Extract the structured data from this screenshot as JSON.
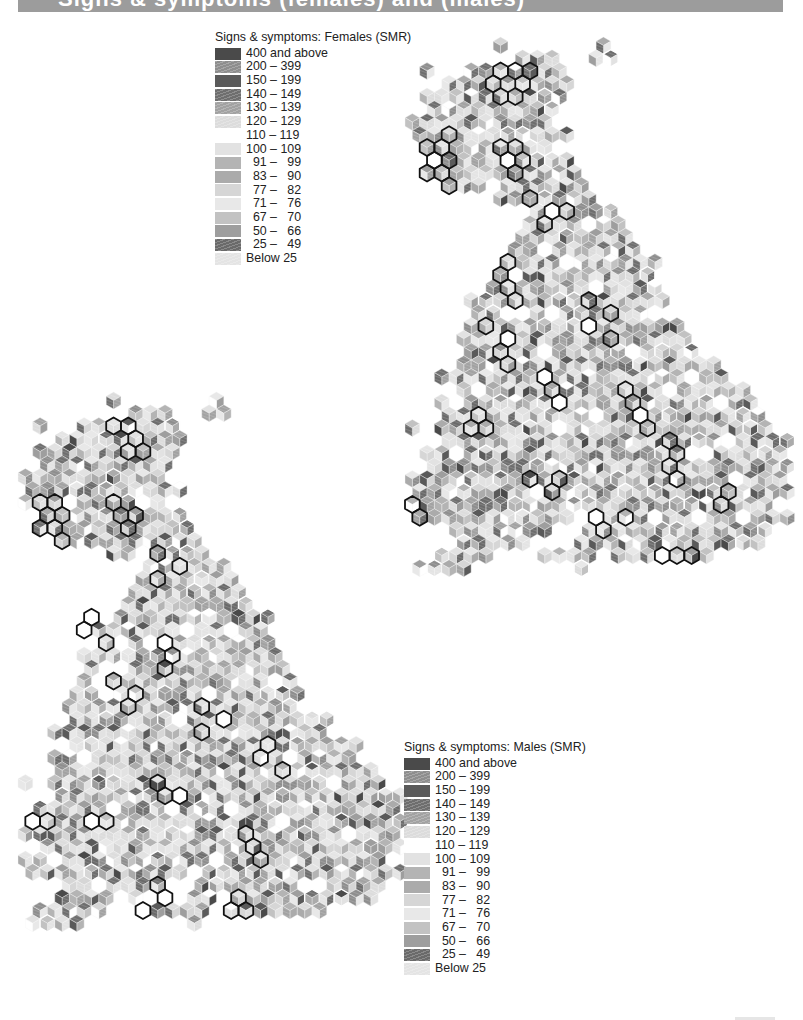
{
  "header": {
    "title": "Signs & symptoms (females) and (males)",
    "bar_color": "#9c9c9c"
  },
  "legend_females": {
    "title": "Signs & symptoms: Females (SMR)",
    "items": [
      {
        "label": "400 and above",
        "color": "#4a4a4a",
        "hatched": false
      },
      {
        "label": "200 – 399",
        "color": "#8e8e8e",
        "hatched": true
      },
      {
        "label": "150 – 199",
        "color": "#5a5a5a",
        "hatched": false
      },
      {
        "label": "140 – 149",
        "color": "#6e6e6e",
        "hatched": true
      },
      {
        "label": "130 – 139",
        "color": "#a2a2a2",
        "hatched": true
      },
      {
        "label": "120 – 129",
        "color": "#dcdcdc",
        "hatched": true
      },
      {
        "label": "110 – 119",
        "color": "#ffffff",
        "hatched": false
      },
      {
        "label": "100 – 109",
        "color": "#e2e2e2",
        "hatched": false
      },
      {
        "label": "  91 –   99",
        "color": "#b4b4b4",
        "hatched": false
      },
      {
        "label": "  83 –   90",
        "color": "#ababab",
        "hatched": false
      },
      {
        "label": "  77 –   82",
        "color": "#d6d6d6",
        "hatched": false
      },
      {
        "label": "  71 –   76",
        "color": "#e8e8e8",
        "hatched": false
      },
      {
        "label": "  67 –   70",
        "color": "#c2c2c2",
        "hatched": false
      },
      {
        "label": "  50 –   66",
        "color": "#9e9e9e",
        "hatched": false
      },
      {
        "label": "  25 –   49",
        "color": "#6a6a6a",
        "hatched": true
      },
      {
        "label": "Below 25",
        "color": "#e4e4e4",
        "hatched": true
      }
    ]
  },
  "legend_males": {
    "title": "Signs & symptoms: Males (SMR)",
    "items": [
      {
        "label": "400 and above",
        "color": "#4a4a4a",
        "hatched": false
      },
      {
        "label": "200 – 399",
        "color": "#8e8e8e",
        "hatched": true
      },
      {
        "label": "150 – 199",
        "color": "#5a5a5a",
        "hatched": false
      },
      {
        "label": "140 – 149",
        "color": "#6e6e6e",
        "hatched": true
      },
      {
        "label": "130 – 139",
        "color": "#a2a2a2",
        "hatched": true
      },
      {
        "label": "120 – 129",
        "color": "#dcdcdc",
        "hatched": true
      },
      {
        "label": "110 – 119",
        "color": "#ffffff",
        "hatched": false
      },
      {
        "label": "100 – 109",
        "color": "#e2e2e2",
        "hatched": false
      },
      {
        "label": "  91 –   99",
        "color": "#b4b4b4",
        "hatched": false
      },
      {
        "label": "  83 –   90",
        "color": "#ababab",
        "hatched": false
      },
      {
        "label": "  77 –   82",
        "color": "#d6d6d6",
        "hatched": false
      },
      {
        "label": "  71 –   76",
        "color": "#e8e8e8",
        "hatched": false
      },
      {
        "label": "  67 –   70",
        "color": "#c2c2c2",
        "hatched": false
      },
      {
        "label": "  50 –   66",
        "color": "#9e9e9e",
        "hatched": false
      },
      {
        "label": "  25 –   49",
        "color": "#6a6a6a",
        "hatched": true
      },
      {
        "label": "Below 25",
        "color": "#e4e4e4",
        "hatched": true
      }
    ]
  },
  "maps": {
    "hex": {
      "width": 14.7,
      "radius": 8.5,
      "row_height": 12.75
    },
    "shape_rows": [
      [
        [
          6,
          6
        ],
        [
          13,
          13
        ]
      ],
      [
        [
          7,
          9
        ],
        [
          12,
          13
        ]
      ],
      [
        [
          1,
          1
        ],
        [
          4,
          10
        ]
      ],
      [
        [
          2,
          10
        ]
      ],
      [
        [
          1,
          10
        ]
      ],
      [
        [
          1,
          9
        ]
      ],
      [
        [
          0,
          9
        ]
      ],
      [
        [
          0,
          10
        ]
      ],
      [
        [
          0,
          9
        ]
      ],
      [
        [
          1,
          10
        ]
      ],
      [
        [
          1,
          11
        ]
      ],
      [
        [
          2,
          11
        ]
      ],
      [
        [
          6,
          12
        ]
      ],
      [
        [
          8,
          13
        ]
      ],
      [
        [
          8,
          14
        ]
      ],
      [
        [
          7,
          14
        ]
      ],
      [
        [
          7,
          15
        ]
      ],
      [
        [
          6,
          16
        ]
      ],
      [
        [
          5,
          16
        ]
      ],
      [
        [
          5,
          16
        ]
      ],
      [
        [
          4,
          17
        ]
      ],
      [
        [
          4,
          17
        ]
      ],
      [
        [
          4,
          18
        ]
      ],
      [
        [
          3,
          18
        ]
      ],
      [
        [
          3,
          19
        ]
      ],
      [
        [
          3,
          20
        ]
      ],
      [
        [
          2,
          21
        ]
      ],
      [
        [
          3,
          22
        ]
      ],
      [
        [
          2,
          23
        ]
      ],
      [
        [
          2,
          23
        ]
      ],
      [
        [
          0,
          0
        ],
        [
          2,
          24
        ]
      ],
      [
        [
          2,
          25
        ]
      ],
      [
        [
          1,
          25
        ]
      ],
      [
        [
          1,
          25
        ]
      ],
      [
        [
          0,
          25
        ]
      ],
      [
        [
          0,
          25
        ]
      ],
      [
        [
          0,
          24
        ]
      ],
      [
        [
          0,
          10
        ],
        [
          12,
          25
        ]
      ],
      [
        [
          3,
          9
        ],
        [
          12,
          24
        ]
      ],
      [
        [
          2,
          7
        ],
        [
          11,
          23
        ]
      ],
      [
        [
          1,
          5
        ],
        [
          9,
          12
        ],
        [
          14,
          20
        ]
      ],
      [
        [
          0,
          3
        ],
        [
          11,
          11
        ]
      ]
    ],
    "females": {
      "origin": [
        405,
        37
      ],
      "seed": 17
    },
    "males": {
      "origin": [
        18,
        392
      ],
      "seed": 53
    },
    "outline_black": "#111111",
    "outline_white": "#ffffff"
  },
  "clusters": {
    "females": [
      [
        [
          2,
          6
        ],
        [
          2,
          7
        ],
        [
          3,
          5
        ],
        [
          3,
          7
        ],
        [
          2,
          8
        ]
      ],
      [
        [
          4,
          6
        ],
        [
          4,
          7
        ]
      ],
      [
        [
          8,
          1
        ],
        [
          9,
          1
        ],
        [
          10,
          1
        ],
        [
          8,
          2
        ],
        [
          9,
          2
        ],
        [
          10,
          2
        ],
        [
          11,
          2
        ],
        [
          7,
          2
        ]
      ],
      [
        [
          8,
          6
        ],
        [
          8,
          7
        ],
        [
          9,
          7
        ],
        [
          10,
          7
        ],
        [
          9,
          6
        ]
      ],
      [
        [
          12,
          8
        ],
        [
          13,
          9
        ],
        [
          14,
          9
        ],
        [
          13,
          10
        ]
      ],
      [
        [
          17,
          6
        ],
        [
          18,
          6
        ],
        [
          19,
          6
        ],
        [
          20,
          7
        ]
      ],
      [
        [
          20,
          12
        ],
        [
          21,
          13
        ],
        [
          22,
          12
        ],
        [
          23,
          13
        ]
      ],
      [
        [
          22,
          5
        ],
        [
          23,
          6
        ],
        [
          24,
          6
        ],
        [
          25,
          6
        ]
      ],
      [
        [
          26,
          9
        ],
        [
          27,
          9
        ],
        [
          28,
          10
        ]
      ],
      [
        [
          27,
          14
        ],
        [
          28,
          15
        ],
        [
          29,
          15
        ],
        [
          30,
          16
        ]
      ],
      [
        [
          29,
          4
        ],
        [
          30,
          4
        ],
        [
          30,
          5
        ]
      ],
      [
        [
          31,
          17
        ],
        [
          32,
          18
        ],
        [
          33,
          17
        ],
        [
          34,
          18
        ]
      ],
      [
        [
          34,
          8
        ],
        [
          35,
          9
        ],
        [
          34,
          10
        ]
      ],
      [
        [
          36,
          0
        ],
        [
          37,
          0
        ]
      ],
      [
        [
          37,
          12
        ],
        [
          38,
          13
        ],
        [
          37,
          14
        ]
      ],
      [
        [
          40,
          18
        ],
        [
          40,
          19
        ],
        [
          40,
          17
        ]
      ],
      [
        [
          35,
          21
        ],
        [
          36,
          21
        ]
      ]
    ],
    "males": [
      [
        [
          2,
          6
        ],
        [
          2,
          7
        ],
        [
          3,
          7
        ]
      ],
      [
        [
          4,
          7
        ],
        [
          4,
          8
        ]
      ],
      [
        [
          8,
          1
        ],
        [
          9,
          1
        ],
        [
          10,
          1
        ],
        [
          8,
          2
        ],
        [
          9,
          2
        ],
        [
          10,
          2
        ],
        [
          11,
          2
        ]
      ],
      [
        [
          8,
          6
        ],
        [
          9,
          7
        ],
        [
          10,
          7
        ],
        [
          9,
          6
        ]
      ],
      [
        [
          12,
          9
        ],
        [
          13,
          10
        ],
        [
          14,
          9
        ]
      ],
      [
        [
          17,
          4
        ],
        [
          18,
          4
        ],
        [
          19,
          5
        ]
      ],
      [
        [
          19,
          9
        ],
        [
          20,
          10
        ],
        [
          21,
          9
        ]
      ],
      [
        [
          22,
          6
        ],
        [
          23,
          7
        ],
        [
          24,
          7
        ]
      ],
      [
        [
          24,
          12
        ],
        [
          25,
          13
        ],
        [
          26,
          12
        ]
      ],
      [
        [
          27,
          16
        ],
        [
          28,
          16
        ],
        [
          29,
          17
        ]
      ],
      [
        [
          30,
          9
        ],
        [
          31,
          9
        ],
        [
          31,
          10
        ]
      ],
      [
        [
          33,
          0
        ],
        [
          33,
          1
        ]
      ],
      [
        [
          33,
          4
        ],
        [
          33,
          5
        ]
      ],
      [
        [
          34,
          15
        ],
        [
          35,
          15
        ],
        [
          36,
          16
        ]
      ],
      [
        [
          38,
          9
        ],
        [
          39,
          9
        ],
        [
          40,
          8
        ]
      ],
      [
        [
          39,
          14
        ],
        [
          40,
          14
        ],
        [
          40,
          15
        ]
      ]
    ]
  },
  "page": {
    "width": 803,
    "height": 1020
  }
}
